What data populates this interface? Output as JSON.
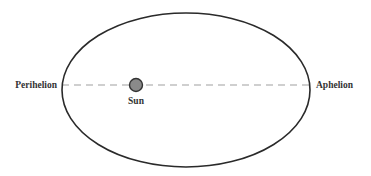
{
  "diagram": {
    "labels": {
      "perihelion": "Perihelion",
      "aphelion": "Aphelion",
      "sun": "Sun"
    },
    "colors": {
      "orbit": "#2a2a2a",
      "axis": "#999999",
      "sun_fill": "#8a8a8a",
      "sun_stroke": "#333333",
      "text": "#333333"
    }
  }
}
